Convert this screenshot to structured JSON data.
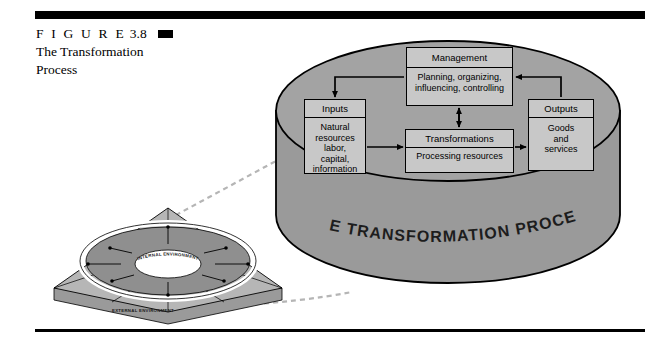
{
  "figure": {
    "label": "F I G U R E",
    "number": "3.8",
    "title_line1": "The Transformation",
    "title_line2": "Process"
  },
  "colors": {
    "rule": "#000000",
    "cylinder_body": "#9a9a9a",
    "cylinder_top": "#a5a5a5",
    "box_fill": "#c8c8c8",
    "box_border": "#000000",
    "slab_top": "#b4b4b4",
    "slab_side": "#8f8f8f",
    "slab_front": "#c0c0c0",
    "ring": "#ffffff",
    "dashed_connector": "#b0b0b0"
  },
  "cylinder": {
    "body_label": "THE TRANSFORMATION PROCESS",
    "boxes": [
      {
        "id": "management",
        "header": "Management",
        "body_line1": "Planning, organizing,",
        "body_line2": "influencing, controlling"
      },
      {
        "id": "inputs",
        "header": "Inputs",
        "body_line1": "Natural",
        "body_line2": "resources",
        "body_line3": "labor,",
        "body_line4": "capital,",
        "body_line5": "information"
      },
      {
        "id": "transformations",
        "header": "Transformations",
        "body_line1": "Processing resources"
      },
      {
        "id": "outputs",
        "header": "Outputs",
        "body_line1": "Goods",
        "body_line2": "and",
        "body_line3": "services"
      }
    ]
  },
  "slab": {
    "inner_label": "INTERNAL ENVIRONMENT",
    "outer_label": "EXTERNAL ENVIRONMENT"
  }
}
